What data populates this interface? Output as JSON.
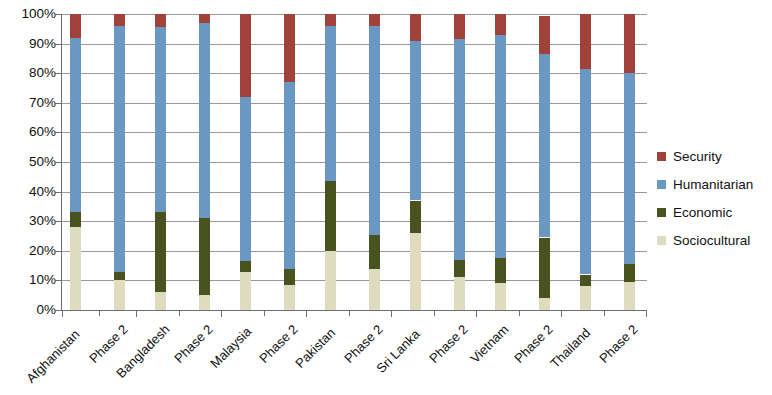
{
  "chart_data": {
    "type": "bar",
    "variant": "stacked-100-percent",
    "title": "",
    "xlabel": "",
    "ylabel": "",
    "ylim": [
      0,
      100
    ],
    "y_tick_labels": [
      "100%",
      "90%",
      "80%",
      "70%",
      "60%",
      "50%",
      "40%",
      "30%",
      "20%",
      "10%",
      "0%"
    ],
    "y_tick_values": [
      100,
      90,
      80,
      70,
      60,
      50,
      40,
      30,
      20,
      10,
      0
    ],
    "grid": true,
    "legend_position": "right",
    "stack_order_bottom_to_top": [
      "Sociocultural",
      "Economic",
      "Humanitarian",
      "Security"
    ],
    "groups": [
      "Afghanistan",
      "Bangladesh",
      "Malaysia",
      "Pakistan",
      "Sri Lanka",
      "Vietnam",
      "Thailand"
    ],
    "categories": [
      "Afghanistan",
      "Phase 2",
      "Bangladesh",
      "Phase 2",
      "Malaysia",
      "Phase 2",
      "Pakistan",
      "Phase 2",
      "Sri Lanka",
      "Phase 2",
      "Vietnam",
      "Phase 2",
      "Thailand",
      "Phase 2"
    ],
    "series": [
      {
        "name": "Sociocultural",
        "color": "#dedbbe",
        "values": [
          28,
          10,
          6,
          5,
          13,
          8.5,
          20,
          14,
          26,
          11,
          9,
          4,
          8,
          9.5
        ]
      },
      {
        "name": "Economic",
        "color": "#48531f",
        "values": [
          5,
          3,
          27,
          26,
          3.5,
          5.5,
          23.5,
          11.5,
          11,
          6,
          8.5,
          20.5,
          4,
          6
        ]
      },
      {
        "name": "Humanitarian",
        "color": "#6b98c2",
        "values": [
          59,
          83,
          62.5,
          66,
          55.5,
          63,
          52.5,
          70.5,
          54,
          74.5,
          75.5,
          62,
          69.5,
          64.5
        ]
      },
      {
        "name": "Security",
        "color": "#a0413a",
        "values": [
          8,
          4,
          4.5,
          3,
          28,
          23,
          4,
          4,
          9,
          8.5,
          7,
          13,
          18.5,
          20
        ]
      }
    ],
    "cumulative_tops": {
      "note": "cumulative stack tops in percent, bottom-to-top",
      "Afghanistan": {
        "sociocultural": 28,
        "economic": 33,
        "humanitarian": 92,
        "security": 100
      },
      "Afghanistan Phase 2": {
        "sociocultural": 10,
        "economic": 13,
        "humanitarian": 96,
        "security": 100
      },
      "Bangladesh": {
        "sociocultural": 6,
        "economic": 33,
        "humanitarian": 95.5,
        "security": 100
      },
      "Bangladesh Phase 2": {
        "sociocultural": 5,
        "economic": 31,
        "humanitarian": 97,
        "security": 100
      },
      "Malaysia": {
        "sociocultural": 13,
        "economic": 16.5,
        "humanitarian": 72,
        "security": 100
      },
      "Malaysia Phase 2": {
        "sociocultural": 8.5,
        "economic": 14,
        "humanitarian": 77,
        "security": 100
      },
      "Pakistan": {
        "sociocultural": 20,
        "economic": 43.5,
        "humanitarian": 96,
        "security": 100
      },
      "Pakistan Phase 2": {
        "sociocultural": 14,
        "economic": 25.5,
        "humanitarian": 96,
        "security": 100
      },
      "Sri Lanka": {
        "sociocultural": 26,
        "economic": 37,
        "humanitarian": 91,
        "security": 100
      },
      "Sri Lanka Phase 2": {
        "sociocultural": 11,
        "economic": 17,
        "humanitarian": 91.5,
        "security": 100
      },
      "Vietnam": {
        "sociocultural": 9,
        "economic": 17.5,
        "humanitarian": 93,
        "security": 100
      },
      "Vietnam Phase 2": {
        "sociocultural": 4,
        "economic": 24.5,
        "humanitarian": 86.5,
        "security": 100
      },
      "Thailand": {
        "sociocultural": 8,
        "economic": 12,
        "humanitarian": 81.5,
        "security": 100
      },
      "Thailand Phase 2": {
        "sociocultural": 9.5,
        "economic": 15.5,
        "humanitarian": 80,
        "security": 100
      }
    }
  },
  "legend": {
    "items": [
      {
        "label": "Security",
        "color": "#a0413a"
      },
      {
        "label": "Humanitarian",
        "color": "#6b98c2"
      },
      {
        "label": "Economic",
        "color": "#48531f"
      },
      {
        "label": "Sociocultural",
        "color": "#dedbbe"
      }
    ]
  },
  "layout": {
    "bar_x_positions": [
      70,
      114,
      155,
      199,
      240,
      284,
      325,
      369,
      410,
      454,
      495,
      539,
      580,
      624
    ],
    "group_divider_x": [
      62,
      136,
      221,
      306,
      391,
      476,
      561,
      646
    ],
    "bar_width": 11,
    "plot_left": 62,
    "plot_top": 14,
    "plot_width": 585,
    "plot_height": 296
  }
}
